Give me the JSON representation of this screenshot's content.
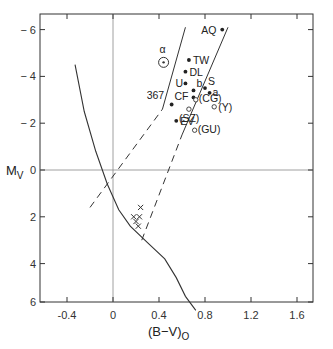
{
  "chart_data": {
    "type": "scatter",
    "title": "",
    "xlabel": "(B-V)0",
    "ylabel": "MV",
    "xlim": [
      -0.55,
      1.75
    ],
    "ylim": [
      6,
      -6.1
    ],
    "y_inverted": true,
    "grid": false,
    "xticks": [
      -0.4,
      0,
      0.4,
      0.8,
      1.2,
      1.6
    ],
    "xtick_labels": [
      "-0.4",
      "0",
      "0.4",
      "0.8",
      "1.2",
      "1.6"
    ],
    "yticks": [
      -6,
      -4,
      -2,
      0,
      2,
      4,
      6
    ],
    "ytick_labels": [
      "-6",
      "-4",
      "-2",
      "0",
      "2",
      "4",
      "6"
    ],
    "reference_lines": [
      {
        "name": "x-zero",
        "orientation": "vertical",
        "value": 0
      },
      {
        "name": "y-zero",
        "orientation": "horizontal",
        "value": 0
      }
    ],
    "curves": [
      {
        "name": "main-sequence",
        "style": "solid",
        "points": [
          [
            -0.33,
            -4.5
          ],
          [
            -0.25,
            -2.5
          ],
          [
            -0.15,
            -0.8
          ],
          [
            -0.05,
            0.6
          ],
          [
            0.05,
            1.7
          ],
          [
            0.15,
            2.4
          ],
          [
            0.3,
            3.1
          ],
          [
            0.45,
            3.8
          ],
          [
            0.55,
            4.6
          ],
          [
            0.63,
            5.4
          ],
          [
            0.72,
            6.0
          ]
        ]
      },
      {
        "name": "instability-strip-blue-edge",
        "style": "dashed-solid",
        "points": [
          [
            -0.2,
            1.6
          ],
          [
            0.43,
            -2.6
          ],
          [
            0.63,
            -6.1
          ]
        ],
        "dashed_until": [
          0.43,
          -2.6
        ]
      },
      {
        "name": "instability-strip-red-edge",
        "style": "dashed-solid",
        "points": [
          [
            0.25,
            3.0
          ],
          [
            0.6,
            -1.5
          ],
          [
            1.0,
            -6.1
          ]
        ],
        "dashed_until": [
          0.6,
          -1.5
        ]
      }
    ],
    "series": [
      {
        "name": "filled",
        "marker": "dot",
        "points": [
          {
            "label": "AQ",
            "x": 0.95,
            "y": -6.0
          },
          {
            "label": "TW",
            "x": 0.66,
            "y": -4.7
          },
          {
            "label": "DL",
            "x": 0.63,
            "y": -4.2
          },
          {
            "label": "U",
            "x": 0.63,
            "y": -3.7
          },
          {
            "label": "b",
            "x": 0.7,
            "y": -3.4
          },
          {
            "label": "S",
            "x": 0.8,
            "y": -3.5
          },
          {
            "label": "a",
            "x": 0.84,
            "y": -3.3
          },
          {
            "label": "CF",
            "x": 0.7,
            "y": -3.1
          },
          {
            "label": "367",
            "x": 0.51,
            "y": -2.8
          },
          {
            "label": "EV",
            "x": 0.55,
            "y": -2.1
          }
        ]
      },
      {
        "name": "open",
        "marker": "circle",
        "points": [
          {
            "label": "(CG)",
            "x": 0.72,
            "y": -3.0
          },
          {
            "label": "(Y)",
            "x": 0.88,
            "y": -2.7
          },
          {
            "label": "(SZ)",
            "x": 0.66,
            "y": -2.6
          },
          {
            "label": "(GU)",
            "x": 0.71,
            "y": -1.7
          }
        ]
      },
      {
        "name": "sun-symbol",
        "marker": "circled-dot",
        "points": [
          {
            "label": "α",
            "x": 0.44,
            "y": -4.6
          }
        ]
      },
      {
        "name": "crosses",
        "marker": "x",
        "points": [
          {
            "x": 0.24,
            "y": 1.6
          },
          {
            "x": 0.18,
            "y": 2.0
          },
          {
            "x": 0.23,
            "y": 2.0
          },
          {
            "x": 0.2,
            "y": 2.2
          },
          {
            "x": 0.22,
            "y": 2.4
          }
        ]
      }
    ]
  },
  "axes": {
    "x_title_main": "(B−V)",
    "x_title_sub": "O",
    "y_title_main": "M",
    "y_title_sub": "V"
  }
}
